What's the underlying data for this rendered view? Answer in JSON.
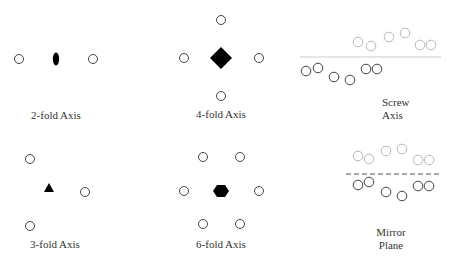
{
  "colors": {
    "symbol": "#000000",
    "circle_dark": "#444444",
    "circle_light": "#b8b8b8",
    "line": "#cccccc",
    "dashed_line": "#555555",
    "text": "#333333"
  },
  "panels": [
    {
      "id": "2-fold",
      "label": "2-fold Axis",
      "symbol": "ellipse-icon"
    },
    {
      "id": "4-fold",
      "label": "4-fold Axis",
      "symbol": "diamond-icon"
    },
    {
      "id": "screw",
      "label_line1": "Screw",
      "label_line2": "Axis",
      "symbol": "solid-line"
    },
    {
      "id": "3-fold",
      "label": "3-fold Axis",
      "symbol": "triangle-icon"
    },
    {
      "id": "6-fold",
      "label": "6-fold Axis",
      "symbol": "hexagon-icon"
    },
    {
      "id": "mirror",
      "label_line1": "Mirror",
      "label_line2": "Plane",
      "symbol": "dashed-line"
    }
  ]
}
